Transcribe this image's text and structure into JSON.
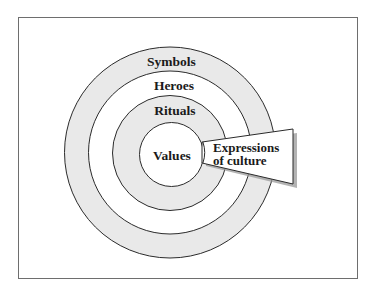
{
  "diagram": {
    "type": "concentric-circles",
    "title": "",
    "layers": [
      {
        "label": "Symbols",
        "level": 1,
        "position": "outermost",
        "fill": "#e9e9e9"
      },
      {
        "label": "Heroes",
        "level": 2,
        "position": "second",
        "fill": "#ffffff"
      },
      {
        "label": "Rituals",
        "level": 3,
        "position": "third",
        "fill": "#e9e9e9"
      },
      {
        "label": "Values",
        "level": 4,
        "position": "core",
        "fill": "#ffffff"
      }
    ],
    "callout": {
      "line1": "Expressions",
      "line2": "of culture",
      "fill": "#ffffff",
      "shadow": "#9a9a9a"
    },
    "colors": {
      "stroke": "#2b2b2b",
      "frame": "#6e6e6e",
      "text": "#1a1a1a",
      "shade": "#e9e9e9"
    }
  }
}
